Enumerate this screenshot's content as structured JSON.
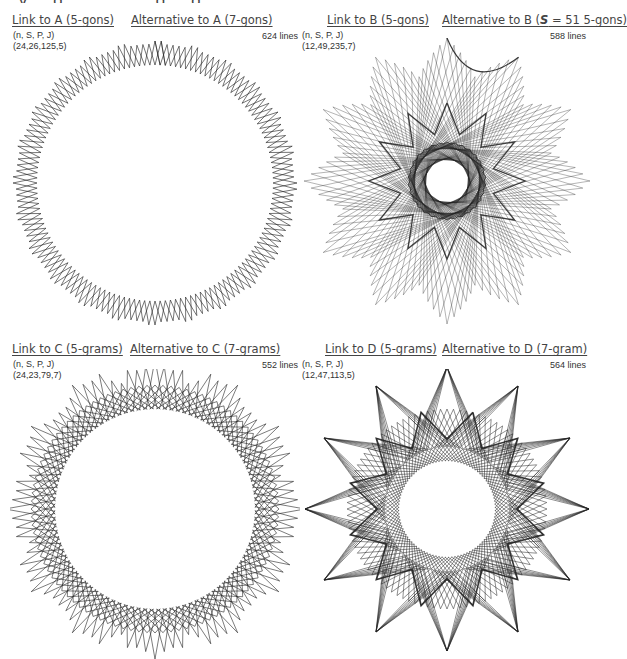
{
  "header_cutoff": "...y ...g... ... ... ...g ...g...",
  "panels": [
    {
      "id": "A",
      "link_label": "Link to A (5-gons)",
      "alt_label": "Alternative to A (7-gons)",
      "param_header": "(n, S, P, J)",
      "param_values": "(24,26,125,5)",
      "line_count": "624 lines",
      "figure": {
        "n": 24,
        "S": 26,
        "P": 125,
        "J": 5,
        "style": "gons",
        "spikes": 24
      }
    },
    {
      "id": "B",
      "link_label": "Link to B (5-gons)",
      "alt_label_prefix": "Alternative to B (",
      "alt_label_italic": "S",
      "alt_label_suffix": " = 51 5-gons)",
      "param_header": "(n, S, P, J)",
      "param_values": "(12,49,235,7)",
      "line_count": "588 lines",
      "figure": {
        "n": 12,
        "S": 49,
        "P": 235,
        "J": 7,
        "style": "gons",
        "spikes": 12
      }
    },
    {
      "id": "C",
      "link_label": "Link to C (5-grams)",
      "alt_label": "Alternative to C (7-grams)",
      "param_header": "(n, S, P, J)",
      "param_values": "(24,23,79,7)",
      "line_count": "552 lines",
      "figure": {
        "n": 24,
        "S": 23,
        "P": 79,
        "J": 7,
        "style": "grams",
        "spikes": 24
      }
    },
    {
      "id": "D",
      "link_label": "Link to D (5-grams)",
      "alt_label": "Alternative to D (7-gram)",
      "param_header": "(n, S, P, J)",
      "param_values": "(12,47,113,5)",
      "line_count": "564 lines",
      "figure": {
        "n": 12,
        "S": 47,
        "P": 113,
        "J": 5,
        "style": "grams",
        "spikes": 12
      }
    }
  ],
  "colors": {
    "stroke": "#222222",
    "text": "#333333",
    "link": "#444444",
    "background": "#ffffff"
  }
}
